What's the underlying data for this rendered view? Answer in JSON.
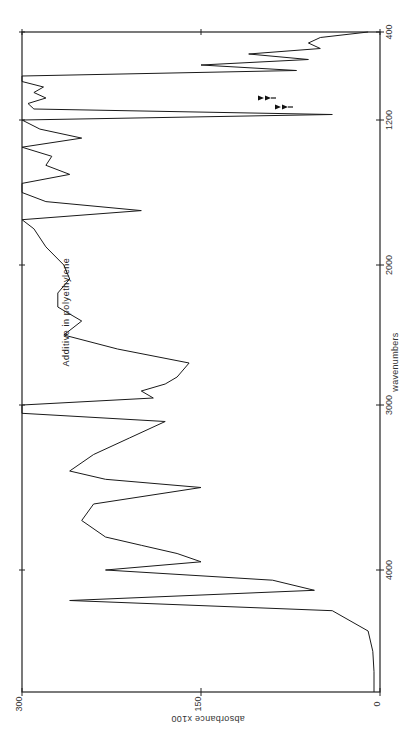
{
  "chart_data": {
    "type": "line",
    "title": "",
    "annotation": "Additive in polyethylene",
    "orientation": "rotated-90",
    "xlabel": "wavenumbers",
    "ylabel": "absorbance x100",
    "x_ticks": [
      4000,
      3000,
      2000,
      1200,
      400
    ],
    "x_tick_labels": [
      "4000",
      "3000",
      "2000",
      "1200",
      "400"
    ],
    "y_ticks": [
      300,
      150,
      0
    ],
    "y_tick_labels": [
      "300",
      "150",
      "0"
    ],
    "xlim": [
      4600,
      400
    ],
    "ylim": [
      0,
      300
    ],
    "grid": false,
    "legend": "none",
    "markers": [
      {
        "type": "arrow",
        "x": 1000,
        "label": ""
      },
      {
        "type": "arrow",
        "x": 960,
        "label": ""
      }
    ],
    "series": [
      {
        "name": "Additive in polyethylene",
        "x": [
          4600,
          4500,
          4400,
          4300,
          4200,
          4150,
          4100,
          4050,
          4000,
          3950,
          3900,
          3850,
          3800,
          3700,
          3600,
          3500,
          3450,
          3400,
          3300,
          3200,
          3100,
          3050,
          3000,
          2950,
          2900,
          2850,
          2800,
          2700,
          2600,
          2500,
          2400,
          2300,
          2200,
          2100,
          2000,
          1900,
          1800,
          1750,
          1700,
          1650,
          1600,
          1550,
          1500,
          1450,
          1400,
          1350,
          1300,
          1250,
          1200,
          1150,
          1100,
          1050,
          1000,
          950,
          900,
          850,
          800,
          750,
          700,
          650,
          600,
          550,
          500,
          450,
          400
        ],
        "values": [
          5,
          5,
          6,
          10,
          40,
          260,
          55,
          90,
          230,
          150,
          170,
          200,
          230,
          250,
          240,
          150,
          230,
          260,
          240,
          210,
          180,
          300,
          300,
          190,
          200,
          180,
          170,
          160,
          220,
          265,
          250,
          270,
          270,
          260,
          265,
          280,
          290,
          300,
          200,
          280,
          300,
          300,
          260,
          280,
          275,
          300,
          250,
          285,
          300,
          40,
          290,
          295,
          280,
          290,
          282,
          300,
          300,
          70,
          150,
          60,
          110,
          50,
          60,
          50,
          10
        ]
      }
    ]
  },
  "header": {
    "caption_visible": false
  }
}
